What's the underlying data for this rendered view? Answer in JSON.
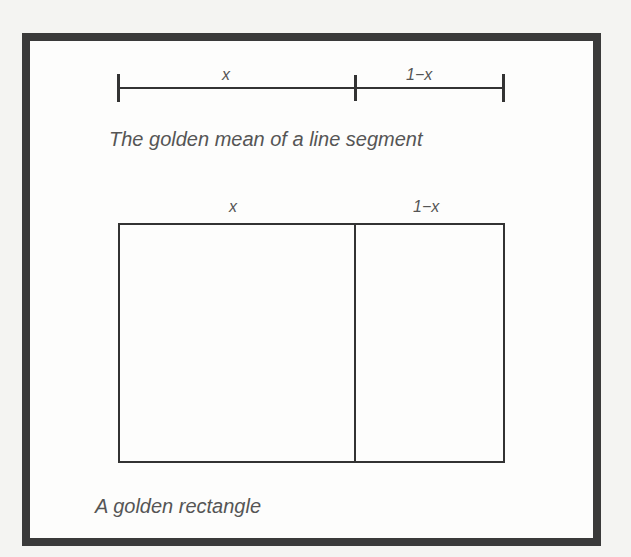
{
  "line_segment": {
    "label_left": "x",
    "label_right": "1−x",
    "caption": "The golden mean of a line segment"
  },
  "golden_rectangle": {
    "label_left": "x",
    "label_right": "1−x",
    "caption": "A golden rectangle"
  },
  "colors": {
    "frame": "#3a3a3a",
    "line": "#333333",
    "text": "#555555",
    "background": "#fdfdfc"
  }
}
